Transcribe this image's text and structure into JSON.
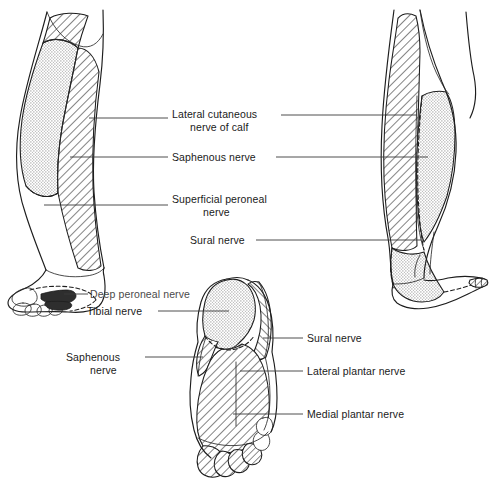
{
  "figure": {
    "background_color": "#ffffff",
    "ink_color": "#1d1d1d",
    "stipple_color": "#b9b9b9",
    "hatch_color": "#1d1d1d"
  },
  "labels": {
    "lateral_cutaneous_nerve_of_calf_line1": "Lateral cutaneous",
    "lateral_cutaneous_nerve_of_calf_line2": "nerve of calf",
    "saphenous_nerve": "Saphenous nerve",
    "superficial_peroneal_nerve_line1": "Superficial peroneal",
    "superficial_peroneal_nerve_line2": "nerve",
    "sural_nerve_upper": "Sural nerve",
    "deep_peroneal_nerve": "Deep peroneal nerve",
    "tibial_nerve": "Tibial nerve",
    "saphenous_nerve_sole_line1": "Saphenous",
    "saphenous_nerve_sole_line2": "nerve",
    "sural_nerve_sole": "Sural nerve",
    "lateral_plantar_nerve": "Lateral plantar nerve",
    "medial_plantar_nerve": "Medial plantar nerve"
  },
  "views": {
    "left": {
      "name": "anterior-view-right-leg",
      "regions": [
        {
          "nerve": "Saphenous nerve",
          "pattern": "stipple",
          "side": "medial"
        },
        {
          "nerve": "Lateral cutaneous nerve of calf",
          "pattern": "hatch",
          "side": "lateral"
        },
        {
          "nerve": "Superficial peroneal nerve",
          "pattern": "hatch",
          "side": "lateral-distal"
        },
        {
          "nerve": "Deep peroneal nerve",
          "pattern": "solid",
          "side": "first-web-space"
        }
      ]
    },
    "right": {
      "name": "lateral-view-leg-and-foot",
      "regions": [
        {
          "nerve": "Lateral cutaneous nerve of calf",
          "pattern": "hatch",
          "side": "anterolateral"
        },
        {
          "nerve": "Sural nerve",
          "pattern": "stipple",
          "side": "posterior"
        },
        {
          "nerve": "Sural nerve",
          "pattern": "stipple",
          "side": "lateral-heel"
        }
      ]
    },
    "sole": {
      "name": "plantar-view-sole",
      "regions": [
        {
          "nerve": "Tibial nerve",
          "pattern": "stipple",
          "side": "heel"
        },
        {
          "nerve": "Sural nerve",
          "pattern": "hatch",
          "side": "lateral-border"
        },
        {
          "nerve": "Saphenous nerve",
          "pattern": "hatch",
          "side": "medial-border"
        },
        {
          "nerve": "Medial plantar nerve",
          "pattern": "hatch",
          "side": "medial-sole"
        },
        {
          "nerve": "Lateral plantar nerve",
          "pattern": "hatch",
          "side": "lateral-sole"
        }
      ]
    }
  }
}
